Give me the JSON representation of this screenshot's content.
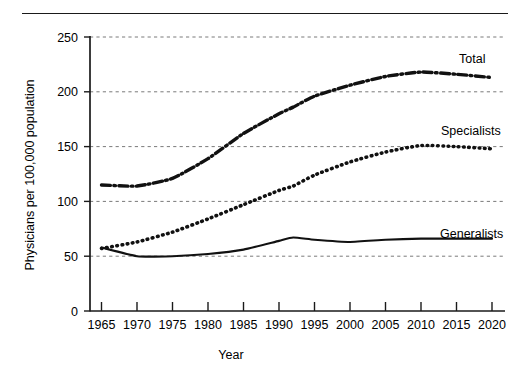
{
  "chart_data": {
    "type": "line",
    "title": "",
    "xlabel": "Year",
    "ylabel": "Physicians per 100,000 population",
    "xlim": [
      1965,
      2020
    ],
    "ylim": [
      0,
      250
    ],
    "grid": true,
    "legend_position": "inline-right",
    "x": [
      1965,
      1970,
      1975,
      1980,
      1985,
      1990,
      1992,
      1995,
      2000,
      2005,
      2010,
      2015,
      2020
    ],
    "xticks": [
      "1965",
      "1970",
      "1975",
      "1980",
      "1985",
      "1990",
      "1995",
      "2000",
      "2005",
      "2010",
      "2015",
      "2020"
    ],
    "yticks": [
      "0",
      "50",
      "100",
      "150",
      "200",
      "250"
    ],
    "series": [
      {
        "name": "Total",
        "style": "dash-dot",
        "color": "#111111",
        "values": [
          115,
          114,
          121,
          139,
          162,
          180,
          186,
          196,
          206,
          214,
          218,
          216,
          213
        ]
      },
      {
        "name": "Specialists",
        "style": "dotted",
        "color": "#111111",
        "values": [
          57,
          63,
          72,
          84,
          97,
          110,
          114,
          124,
          136,
          145,
          151,
          150,
          148
        ]
      },
      {
        "name": "Generalists",
        "style": "solid",
        "color": "#111111",
        "values": [
          58,
          50,
          50,
          52,
          56,
          64,
          67,
          65,
          63,
          65,
          66,
          66,
          66
        ]
      }
    ]
  },
  "axis": {
    "x_title": "Year",
    "y_title": "Physicians per 100,000 population"
  },
  "labels": {
    "total": "Total",
    "specialists": "Specialists",
    "generalists": "Generalists"
  }
}
